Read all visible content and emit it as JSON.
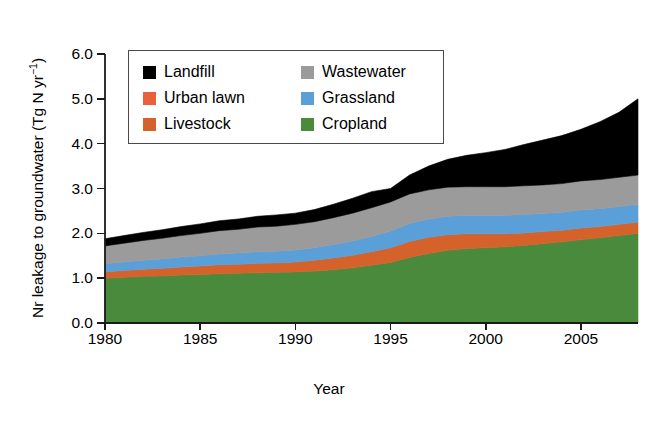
{
  "chart_data": {
    "type": "area",
    "stacked": true,
    "title": "",
    "subtitle": "",
    "xlabel": "Year",
    "ylabel": "Nr leakage to groundwater (Tg N yr⁻¹)",
    "xlim": [
      1980,
      2008
    ],
    "ylim": [
      0.0,
      6.0
    ],
    "grid": false,
    "legend_position": "top-left-inside",
    "x": [
      1980,
      1981,
      1982,
      1983,
      1984,
      1985,
      1986,
      1987,
      1988,
      1989,
      1990,
      1991,
      1992,
      1993,
      1994,
      1995,
      1996,
      1997,
      1998,
      1999,
      2000,
      2001,
      2002,
      2003,
      2004,
      2005,
      2006,
      2007,
      2008
    ],
    "series": [
      {
        "name": "Cropland",
        "color": "#4a8a3c",
        "values": [
          1.0,
          1.02,
          1.04,
          1.05,
          1.07,
          1.08,
          1.1,
          1.11,
          1.12,
          1.13,
          1.14,
          1.16,
          1.19,
          1.23,
          1.29,
          1.35,
          1.46,
          1.55,
          1.62,
          1.66,
          1.68,
          1.7,
          1.73,
          1.77,
          1.81,
          1.86,
          1.9,
          1.95,
          2.0
        ]
      },
      {
        "name": "Livestock",
        "color": "#d4622a",
        "values": [
          0.14,
          0.15,
          0.16,
          0.17,
          0.18,
          0.19,
          0.2,
          0.2,
          0.21,
          0.21,
          0.22,
          0.24,
          0.26,
          0.28,
          0.3,
          0.33,
          0.36,
          0.36,
          0.35,
          0.33,
          0.31,
          0.29,
          0.28,
          0.27,
          0.26,
          0.26,
          0.25,
          0.25,
          0.25
        ]
      },
      {
        "name": "Grassland",
        "color": "#5a9fd8",
        "values": [
          0.18,
          0.19,
          0.2,
          0.21,
          0.22,
          0.23,
          0.24,
          0.25,
          0.26,
          0.26,
          0.27,
          0.28,
          0.3,
          0.32,
          0.34,
          0.37,
          0.4,
          0.41,
          0.41,
          0.41,
          0.41,
          0.41,
          0.41,
          0.4,
          0.4,
          0.4,
          0.4,
          0.4,
          0.4
        ]
      },
      {
        "name": "Wastewater",
        "color": "#9b9b9b",
        "values": [
          0.4,
          0.42,
          0.44,
          0.46,
          0.48,
          0.5,
          0.52,
          0.53,
          0.55,
          0.56,
          0.57,
          0.58,
          0.6,
          0.62,
          0.64,
          0.65,
          0.66,
          0.65,
          0.65,
          0.64,
          0.64,
          0.64,
          0.64,
          0.64,
          0.64,
          0.65,
          0.65,
          0.65,
          0.65
        ]
      },
      {
        "name": "Landfill",
        "color": "#000000",
        "values": [
          0.16,
          0.17,
          0.18,
          0.19,
          0.2,
          0.21,
          0.22,
          0.23,
          0.24,
          0.25,
          0.25,
          0.27,
          0.3,
          0.33,
          0.36,
          0.3,
          0.42,
          0.53,
          0.62,
          0.7,
          0.76,
          0.83,
          0.92,
          1.0,
          1.07,
          1.15,
          1.29,
          1.45,
          1.7
        ]
      }
    ],
    "totals": [
      1.88,
      1.95,
      2.02,
      2.08,
      2.15,
      2.21,
      2.28,
      2.32,
      2.38,
      2.41,
      2.45,
      2.53,
      2.65,
      2.78,
      2.93,
      3.0,
      3.3,
      3.5,
      3.65,
      3.74,
      3.8,
      3.87,
      3.98,
      4.08,
      4.18,
      4.32,
      4.49,
      4.7,
      5.0
    ],
    "yticks": [
      "0.0",
      "1.0",
      "2.0",
      "3.0",
      "4.0",
      "5.0",
      "6.0"
    ],
    "ytick_values": [
      0.0,
      1.0,
      2.0,
      3.0,
      4.0,
      5.0,
      6.0
    ],
    "xticks": [
      "1980",
      "1985",
      "1990",
      "1995",
      "2000",
      "2005"
    ],
    "xtick_values": [
      1980,
      1985,
      1990,
      1995,
      2000,
      2005
    ]
  },
  "axis": {
    "ylabel_prefix": "Nr leakage to groundwater (Tg N yr",
    "ylabel_suffix": ")",
    "ylabel_exponent": "−1",
    "xlabel": "Year"
  },
  "legend": {
    "left_column": [
      {
        "label": "Landfill",
        "color": "#000000"
      },
      {
        "label": "Urban lawn",
        "color": "#e8613c"
      },
      {
        "label": "Livestock",
        "color": "#d4622a"
      }
    ],
    "right_column": [
      {
        "label": "Wastewater",
        "color": "#9b9b9b"
      },
      {
        "label": "Grassland",
        "color": "#5a9fd8"
      },
      {
        "label": "Cropland",
        "color": "#4a8a3c"
      }
    ]
  }
}
